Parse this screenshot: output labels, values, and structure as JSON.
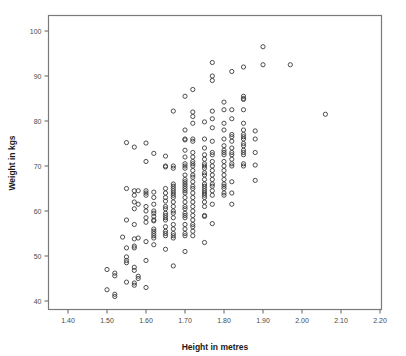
{
  "chart_data": {
    "type": "scatter",
    "title": "",
    "xlabel": "Height in metres",
    "ylabel": "Weight in kgs",
    "xlim": [
      1.35,
      2.25
    ],
    "ylim": [
      37.5,
      103
    ],
    "xticks": [
      1.4,
      1.5,
      1.6,
      1.7,
      1.8,
      1.9,
      2.0,
      2.1,
      2.2
    ],
    "xtick_labels": [
      "1.40",
      "1.50",
      "1.60",
      "1.70",
      "1.80",
      "1.90",
      "2.00",
      "2.10",
      "2.20"
    ],
    "yticks": [
      40,
      50,
      60,
      70,
      80,
      90,
      100
    ],
    "ytick_labels": [
      "40",
      "50",
      "60",
      "70",
      "80",
      "90",
      "100"
    ],
    "grid": false,
    "legend": false,
    "marker": "open-circle",
    "marker_color": "#3a3a3a",
    "marker_size": 4.2,
    "points": [
      [
        1.5,
        47.0
      ],
      [
        1.5,
        42.5
      ],
      [
        1.52,
        46.2
      ],
      [
        1.52,
        45.6
      ],
      [
        1.52,
        41.5
      ],
      [
        1.52,
        41.0
      ],
      [
        1.54,
        54.2
      ],
      [
        1.55,
        75.2
      ],
      [
        1.55,
        65.0
      ],
      [
        1.55,
        58.0
      ],
      [
        1.55,
        49.8
      ],
      [
        1.55,
        49.0
      ],
      [
        1.55,
        48.5
      ],
      [
        1.55,
        51.8
      ],
      [
        1.55,
        44.2
      ],
      [
        1.57,
        74.2
      ],
      [
        1.57,
        64.5
      ],
      [
        1.57,
        63.5
      ],
      [
        1.57,
        62.0
      ],
      [
        1.57,
        60.5
      ],
      [
        1.57,
        57.0
      ],
      [
        1.57,
        53.8
      ],
      [
        1.57,
        52.2
      ],
      [
        1.57,
        51.8
      ],
      [
        1.57,
        47.5
      ],
      [
        1.57,
        46.8
      ],
      [
        1.57,
        44.0
      ],
      [
        1.57,
        43.5
      ],
      [
        1.58,
        64.5
      ],
      [
        1.58,
        61.5
      ],
      [
        1.58,
        54.0
      ],
      [
        1.58,
        45.5
      ],
      [
        1.58,
        45.0
      ],
      [
        1.6,
        75.1
      ],
      [
        1.6,
        71.0
      ],
      [
        1.6,
        64.5
      ],
      [
        1.6,
        64.0
      ],
      [
        1.6,
        63.5
      ],
      [
        1.6,
        61.0
      ],
      [
        1.6,
        60.0
      ],
      [
        1.6,
        58.5
      ],
      [
        1.6,
        57.5
      ],
      [
        1.6,
        53.2
      ],
      [
        1.6,
        49.0
      ],
      [
        1.6,
        43.0
      ],
      [
        1.62,
        72.8
      ],
      [
        1.62,
        64.2
      ],
      [
        1.62,
        63.0
      ],
      [
        1.62,
        61.5
      ],
      [
        1.62,
        60.0
      ],
      [
        1.62,
        59.5
      ],
      [
        1.62,
        58.8
      ],
      [
        1.62,
        58.0
      ],
      [
        1.62,
        57.8
      ],
      [
        1.62,
        56.0
      ],
      [
        1.62,
        55.5
      ],
      [
        1.62,
        55.0
      ],
      [
        1.62,
        54.5
      ],
      [
        1.62,
        54.0
      ],
      [
        1.62,
        52.5
      ],
      [
        1.65,
        72.2
      ],
      [
        1.65,
        70.0
      ],
      [
        1.65,
        69.8
      ],
      [
        1.65,
        65.0
      ],
      [
        1.65,
        64.0
      ],
      [
        1.65,
        63.0
      ],
      [
        1.65,
        62.2
      ],
      [
        1.65,
        61.0
      ],
      [
        1.65,
        60.5
      ],
      [
        1.65,
        59.5
      ],
      [
        1.65,
        59.0
      ],
      [
        1.65,
        58.5
      ],
      [
        1.65,
        58.0
      ],
      [
        1.65,
        56.5
      ],
      [
        1.65,
        55.5
      ],
      [
        1.65,
        55.0
      ],
      [
        1.65,
        54.5
      ],
      [
        1.65,
        51.5
      ],
      [
        1.67,
        82.2
      ],
      [
        1.67,
        70.0
      ],
      [
        1.67,
        69.5
      ],
      [
        1.67,
        66.0
      ],
      [
        1.67,
        65.5
      ],
      [
        1.67,
        65.0
      ],
      [
        1.67,
        64.5
      ],
      [
        1.67,
        64.0
      ],
      [
        1.67,
        63.5
      ],
      [
        1.67,
        63.0
      ],
      [
        1.67,
        62.0
      ],
      [
        1.67,
        61.0
      ],
      [
        1.67,
        60.0
      ],
      [
        1.67,
        59.5
      ],
      [
        1.67,
        58.5
      ],
      [
        1.67,
        57.0
      ],
      [
        1.67,
        56.0
      ],
      [
        1.67,
        55.0
      ],
      [
        1.67,
        54.5
      ],
      [
        1.67,
        54.0
      ],
      [
        1.67,
        47.8
      ],
      [
        1.7,
        85.5
      ],
      [
        1.7,
        78.0
      ],
      [
        1.7,
        76.0
      ],
      [
        1.7,
        75.8
      ],
      [
        1.7,
        73.5
      ],
      [
        1.7,
        72.0
      ],
      [
        1.7,
        70.5
      ],
      [
        1.7,
        70.0
      ],
      [
        1.7,
        69.5
      ],
      [
        1.7,
        68.0
      ],
      [
        1.7,
        67.0
      ],
      [
        1.7,
        66.5
      ],
      [
        1.7,
        66.0
      ],
      [
        1.7,
        65.5
      ],
      [
        1.7,
        65.0
      ],
      [
        1.7,
        64.5
      ],
      [
        1.7,
        64.0
      ],
      [
        1.7,
        63.0
      ],
      [
        1.7,
        62.0
      ],
      [
        1.7,
        61.0
      ],
      [
        1.7,
        60.5
      ],
      [
        1.7,
        59.5
      ],
      [
        1.7,
        59.0
      ],
      [
        1.7,
        58.5
      ],
      [
        1.7,
        57.0
      ],
      [
        1.7,
        56.0
      ],
      [
        1.7,
        55.0
      ],
      [
        1.7,
        54.5
      ],
      [
        1.7,
        51.0
      ],
      [
        1.72,
        87.0
      ],
      [
        1.72,
        82.0
      ],
      [
        1.72,
        81.0
      ],
      [
        1.72,
        79.5
      ],
      [
        1.72,
        76.0
      ],
      [
        1.72,
        75.5
      ],
      [
        1.72,
        73.0
      ],
      [
        1.72,
        72.0
      ],
      [
        1.72,
        71.0
      ],
      [
        1.72,
        70.5
      ],
      [
        1.72,
        70.0
      ],
      [
        1.72,
        69.0
      ],
      [
        1.72,
        68.0
      ],
      [
        1.72,
        67.5
      ],
      [
        1.72,
        66.5
      ],
      [
        1.72,
        65.5
      ],
      [
        1.72,
        65.0
      ],
      [
        1.72,
        64.0
      ],
      [
        1.72,
        63.0
      ],
      [
        1.72,
        62.0
      ],
      [
        1.72,
        61.0
      ],
      [
        1.72,
        60.0
      ],
      [
        1.72,
        59.0
      ],
      [
        1.72,
        58.0
      ],
      [
        1.72,
        57.0
      ],
      [
        1.72,
        56.5
      ],
      [
        1.72,
        55.5
      ],
      [
        1.72,
        54.5
      ],
      [
        1.75,
        79.8
      ],
      [
        1.75,
        76.0
      ],
      [
        1.75,
        74.0
      ],
      [
        1.75,
        72.5
      ],
      [
        1.75,
        71.5
      ],
      [
        1.75,
        70.5
      ],
      [
        1.75,
        70.0
      ],
      [
        1.75,
        69.5
      ],
      [
        1.75,
        68.5
      ],
      [
        1.75,
        68.0
      ],
      [
        1.75,
        67.0
      ],
      [
        1.75,
        66.0
      ],
      [
        1.75,
        65.5
      ],
      [
        1.75,
        65.0
      ],
      [
        1.75,
        64.5
      ],
      [
        1.75,
        64.0
      ],
      [
        1.75,
        63.5
      ],
      [
        1.75,
        63.0
      ],
      [
        1.75,
        62.0
      ],
      [
        1.75,
        61.0
      ],
      [
        1.75,
        59.0
      ],
      [
        1.75,
        58.8
      ],
      [
        1.75,
        53.0
      ],
      [
        1.77,
        93.0
      ],
      [
        1.77,
        90.0
      ],
      [
        1.77,
        89.0
      ],
      [
        1.77,
        82.2
      ],
      [
        1.77,
        80.5
      ],
      [
        1.77,
        78.5
      ],
      [
        1.77,
        75.5
      ],
      [
        1.77,
        73.0
      ],
      [
        1.77,
        72.5
      ],
      [
        1.77,
        71.0
      ],
      [
        1.77,
        70.0
      ],
      [
        1.77,
        69.0
      ],
      [
        1.77,
        68.0
      ],
      [
        1.77,
        67.0
      ],
      [
        1.77,
        66.0
      ],
      [
        1.77,
        65.5
      ],
      [
        1.77,
        64.5
      ],
      [
        1.77,
        63.5
      ],
      [
        1.77,
        61.5
      ],
      [
        1.77,
        57.2
      ],
      [
        1.8,
        84.2
      ],
      [
        1.8,
        82.5
      ],
      [
        1.8,
        79.5
      ],
      [
        1.8,
        78.0
      ],
      [
        1.8,
        76.0
      ],
      [
        1.8,
        74.5
      ],
      [
        1.8,
        73.5
      ],
      [
        1.8,
        73.0
      ],
      [
        1.8,
        72.5
      ],
      [
        1.8,
        71.0
      ],
      [
        1.8,
        70.0
      ],
      [
        1.8,
        69.0
      ],
      [
        1.8,
        68.0
      ],
      [
        1.8,
        67.0
      ],
      [
        1.8,
        66.0
      ],
      [
        1.8,
        65.5
      ],
      [
        1.8,
        65.0
      ],
      [
        1.8,
        64.0
      ],
      [
        1.8,
        63.5
      ],
      [
        1.82,
        91.0
      ],
      [
        1.82,
        82.5
      ],
      [
        1.82,
        80.5
      ],
      [
        1.82,
        77.0
      ],
      [
        1.82,
        76.5
      ],
      [
        1.82,
        75.5
      ],
      [
        1.82,
        74.0
      ],
      [
        1.82,
        73.0
      ],
      [
        1.82,
        72.5
      ],
      [
        1.82,
        71.5
      ],
      [
        1.82,
        70.5
      ],
      [
        1.82,
        70.0
      ],
      [
        1.82,
        66.5
      ],
      [
        1.82,
        64.0
      ],
      [
        1.82,
        61.5
      ],
      [
        1.85,
        92.0
      ],
      [
        1.85,
        85.5
      ],
      [
        1.85,
        85.0
      ],
      [
        1.85,
        84.8
      ],
      [
        1.85,
        82.5
      ],
      [
        1.85,
        79.5
      ],
      [
        1.85,
        78.0
      ],
      [
        1.85,
        77.0
      ],
      [
        1.85,
        76.5
      ],
      [
        1.85,
        76.0
      ],
      [
        1.85,
        75.0
      ],
      [
        1.85,
        74.5
      ],
      [
        1.85,
        73.5
      ],
      [
        1.85,
        73.0
      ],
      [
        1.85,
        72.5
      ],
      [
        1.85,
        70.5
      ],
      [
        1.85,
        70.0
      ],
      [
        1.88,
        77.8
      ],
      [
        1.88,
        76.0
      ],
      [
        1.88,
        73.0
      ],
      [
        1.88,
        70.2
      ],
      [
        1.88,
        66.8
      ],
      [
        1.9,
        96.5
      ],
      [
        1.9,
        92.5
      ],
      [
        1.97,
        92.5
      ],
      [
        2.06,
        81.5
      ]
    ]
  },
  "axis": {
    "x_title": "Height in metres",
    "y_title": "Weight in kgs"
  }
}
